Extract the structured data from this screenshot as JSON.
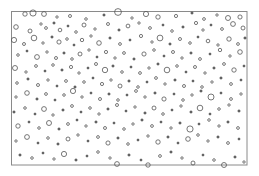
{
  "figure": {
    "title": "",
    "background_color": "#ffffff",
    "width": 259,
    "height": 176
  },
  "frame": {
    "name": "plot-border-rectangle",
    "x": 11.5,
    "y": 11.5,
    "width": 235.5,
    "height": 153.5,
    "stroke_color": "#8a8a8a",
    "stroke_width": 1,
    "fill": "none"
  },
  "chart_data": {
    "type": "scatter",
    "title": "",
    "xlabel": "",
    "ylabel": "",
    "xlim": [
      11,
      247
    ],
    "ylim": [
      11,
      165
    ],
    "grid": false,
    "legend": null,
    "marker": {
      "shape": "circle",
      "fill": "none",
      "stroke_color": "#555555",
      "stroke_width": 0.8,
      "radius_range": [
        0.9,
        4.6
      ]
    },
    "point_count": 231,
    "points": [
      {
        "x": 25,
        "y": 14,
        "r": 2.2
      },
      {
        "x": 33,
        "y": 13,
        "r": 3.1
      },
      {
        "x": 44,
        "y": 14,
        "r": 2.4
      },
      {
        "x": 57,
        "y": 17,
        "r": 1.2
      },
      {
        "x": 70,
        "y": 16,
        "r": 1.5
      },
      {
        "x": 86,
        "y": 19,
        "r": 1.3
      },
      {
        "x": 104,
        "y": 15,
        "r": 1.1
      },
      {
        "x": 118,
        "y": 12,
        "r": 3.4
      },
      {
        "x": 132,
        "y": 18,
        "r": 1.2
      },
      {
        "x": 146,
        "y": 14,
        "r": 2.6
      },
      {
        "x": 158,
        "y": 17,
        "r": 2.2
      },
      {
        "x": 176,
        "y": 16,
        "r": 1.6
      },
      {
        "x": 192,
        "y": 13,
        "r": 1.1
      },
      {
        "x": 204,
        "y": 19,
        "r": 1.4
      },
      {
        "x": 217,
        "y": 15,
        "r": 1.2
      },
      {
        "x": 228,
        "y": 18,
        "r": 2.5
      },
      {
        "x": 240,
        "y": 17,
        "r": 2.1
      },
      {
        "x": 16,
        "y": 27,
        "r": 2.3
      },
      {
        "x": 30,
        "y": 31,
        "r": 2.0
      },
      {
        "x": 41,
        "y": 24,
        "r": 1.2
      },
      {
        "x": 46,
        "y": 28,
        "r": 1.4
      },
      {
        "x": 54,
        "y": 23,
        "r": 1.1
      },
      {
        "x": 60,
        "y": 30,
        "r": 1.8
      },
      {
        "x": 68,
        "y": 26,
        "r": 1.0
      },
      {
        "x": 76,
        "y": 32,
        "r": 1.3
      },
      {
        "x": 84,
        "y": 25,
        "r": 2.0
      },
      {
        "x": 95,
        "y": 29,
        "r": 1.2
      },
      {
        "x": 108,
        "y": 24,
        "r": 1.5
      },
      {
        "x": 119,
        "y": 30,
        "r": 1.1
      },
      {
        "x": 128,
        "y": 26,
        "r": 1.9
      },
      {
        "x": 139,
        "y": 23,
        "r": 1.2
      },
      {
        "x": 150,
        "y": 28,
        "r": 1.4
      },
      {
        "x": 163,
        "y": 25,
        "r": 1.0
      },
      {
        "x": 172,
        "y": 31,
        "r": 1.3
      },
      {
        "x": 183,
        "y": 27,
        "r": 1.1
      },
      {
        "x": 196,
        "y": 23,
        "r": 1.6
      },
      {
        "x": 203,
        "y": 30,
        "r": 1.2
      },
      {
        "x": 211,
        "y": 25,
        "r": 1.0
      },
      {
        "x": 222,
        "y": 29,
        "r": 1.4
      },
      {
        "x": 233,
        "y": 24,
        "r": 2.4
      },
      {
        "x": 243,
        "y": 28,
        "r": 2.0
      },
      {
        "x": 14,
        "y": 40,
        "r": 2.6
      },
      {
        "x": 24,
        "y": 44,
        "r": 1.5
      },
      {
        "x": 34,
        "y": 38,
        "r": 2.8
      },
      {
        "x": 43,
        "y": 43,
        "r": 1.2
      },
      {
        "x": 52,
        "y": 37,
        "r": 1.1
      },
      {
        "x": 59,
        "y": 42,
        "r": 2.1
      },
      {
        "x": 67,
        "y": 39,
        "r": 1.3
      },
      {
        "x": 74,
        "y": 45,
        "r": 1.0
      },
      {
        "x": 82,
        "y": 40,
        "r": 1.7
      },
      {
        "x": 91,
        "y": 36,
        "r": 1.2
      },
      {
        "x": 99,
        "y": 43,
        "r": 2.3
      },
      {
        "x": 110,
        "y": 38,
        "r": 1.1
      },
      {
        "x": 120,
        "y": 44,
        "r": 1.4
      },
      {
        "x": 130,
        "y": 40,
        "r": 1.0
      },
      {
        "x": 141,
        "y": 36,
        "r": 1.6
      },
      {
        "x": 152,
        "y": 42,
        "r": 1.2
      },
      {
        "x": 160,
        "y": 38,
        "r": 2.9
      },
      {
        "x": 170,
        "y": 44,
        "r": 1.1
      },
      {
        "x": 180,
        "y": 39,
        "r": 1.5
      },
      {
        "x": 190,
        "y": 43,
        "r": 1.3
      },
      {
        "x": 198,
        "y": 37,
        "r": 1.0
      },
      {
        "x": 208,
        "y": 41,
        "r": 1.8
      },
      {
        "x": 218,
        "y": 45,
        "r": 1.2
      },
      {
        "x": 229,
        "y": 39,
        "r": 2.2
      },
      {
        "x": 238,
        "y": 44,
        "r": 1.4
      },
      {
        "x": 245,
        "y": 38,
        "r": 1.1
      },
      {
        "x": 18,
        "y": 55,
        "r": 1.3
      },
      {
        "x": 27,
        "y": 51,
        "r": 1.0
      },
      {
        "x": 37,
        "y": 57,
        "r": 2.4
      },
      {
        "x": 47,
        "y": 52,
        "r": 1.2
      },
      {
        "x": 56,
        "y": 58,
        "r": 1.5
      },
      {
        "x": 64,
        "y": 53,
        "r": 1.1
      },
      {
        "x": 72,
        "y": 59,
        "r": 1.3
      },
      {
        "x": 80,
        "y": 54,
        "r": 2.0
      },
      {
        "x": 89,
        "y": 50,
        "r": 1.2
      },
      {
        "x": 97,
        "y": 57,
        "r": 1.0
      },
      {
        "x": 106,
        "y": 52,
        "r": 1.6
      },
      {
        "x": 115,
        "y": 58,
        "r": 1.2
      },
      {
        "x": 124,
        "y": 53,
        "r": 1.4
      },
      {
        "x": 134,
        "y": 59,
        "r": 1.1
      },
      {
        "x": 144,
        "y": 54,
        "r": 2.1
      },
      {
        "x": 154,
        "y": 50,
        "r": 1.3
      },
      {
        "x": 164,
        "y": 56,
        "r": 1.0
      },
      {
        "x": 173,
        "y": 52,
        "r": 1.5
      },
      {
        "x": 182,
        "y": 58,
        "r": 1.2
      },
      {
        "x": 191,
        "y": 53,
        "r": 1.1
      },
      {
        "x": 200,
        "y": 59,
        "r": 1.4
      },
      {
        "x": 210,
        "y": 54,
        "r": 1.0
      },
      {
        "x": 220,
        "y": 50,
        "r": 1.7
      },
      {
        "x": 230,
        "y": 56,
        "r": 1.2
      },
      {
        "x": 240,
        "y": 52,
        "r": 2.3
      },
      {
        "x": 15,
        "y": 68,
        "r": 2.5
      },
      {
        "x": 26,
        "y": 72,
        "r": 1.2
      },
      {
        "x": 36,
        "y": 66,
        "r": 1.4
      },
      {
        "x": 45,
        "y": 71,
        "r": 1.0
      },
      {
        "x": 53,
        "y": 65,
        "r": 1.3
      },
      {
        "x": 62,
        "y": 70,
        "r": 1.1
      },
      {
        "x": 71,
        "y": 67,
        "r": 1.6
      },
      {
        "x": 79,
        "y": 73,
        "r": 1.2
      },
      {
        "x": 88,
        "y": 68,
        "r": 1.0
      },
      {
        "x": 96,
        "y": 64,
        "r": 1.5
      },
      {
        "x": 105,
        "y": 70,
        "r": 2.7
      },
      {
        "x": 113,
        "y": 66,
        "r": 1.1
      },
      {
        "x": 122,
        "y": 72,
        "r": 1.3
      },
      {
        "x": 131,
        "y": 67,
        "r": 1.0
      },
      {
        "x": 140,
        "y": 73,
        "r": 1.4
      },
      {
        "x": 149,
        "y": 68,
        "r": 1.2
      },
      {
        "x": 158,
        "y": 64,
        "r": 1.1
      },
      {
        "x": 167,
        "y": 70,
        "r": 2.8
      },
      {
        "x": 177,
        "y": 66,
        "r": 1.3
      },
      {
        "x": 186,
        "y": 72,
        "r": 1.0
      },
      {
        "x": 195,
        "y": 67,
        "r": 1.5
      },
      {
        "x": 205,
        "y": 73,
        "r": 1.2
      },
      {
        "x": 214,
        "y": 68,
        "r": 1.1
      },
      {
        "x": 224,
        "y": 64,
        "r": 1.4
      },
      {
        "x": 234,
        "y": 70,
        "r": 2.2
      },
      {
        "x": 244,
        "y": 66,
        "r": 1.0
      },
      {
        "x": 17,
        "y": 83,
        "r": 1.3
      },
      {
        "x": 28,
        "y": 79,
        "r": 1.1
      },
      {
        "x": 38,
        "y": 85,
        "r": 1.5
      },
      {
        "x": 48,
        "y": 80,
        "r": 1.2
      },
      {
        "x": 57,
        "y": 86,
        "r": 1.0
      },
      {
        "x": 66,
        "y": 81,
        "r": 1.4
      },
      {
        "x": 75,
        "y": 87,
        "r": 1.1
      },
      {
        "x": 84,
        "y": 82,
        "r": 1.3
      },
      {
        "x": 93,
        "y": 78,
        "r": 1.0
      },
      {
        "x": 102,
        "y": 84,
        "r": 1.6
      },
      {
        "x": 111,
        "y": 80,
        "r": 1.2
      },
      {
        "x": 120,
        "y": 86,
        "r": 2.0
      },
      {
        "x": 129,
        "y": 81,
        "r": 1.1
      },
      {
        "x": 138,
        "y": 87,
        "r": 1.3
      },
      {
        "x": 147,
        "y": 82,
        "r": 1.0
      },
      {
        "x": 156,
        "y": 78,
        "r": 1.4
      },
      {
        "x": 165,
        "y": 84,
        "r": 1.2
      },
      {
        "x": 175,
        "y": 80,
        "r": 1.1
      },
      {
        "x": 184,
        "y": 86,
        "r": 1.5
      },
      {
        "x": 193,
        "y": 81,
        "r": 1.0
      },
      {
        "x": 202,
        "y": 87,
        "r": 1.3
      },
      {
        "x": 212,
        "y": 82,
        "r": 1.2
      },
      {
        "x": 221,
        "y": 78,
        "r": 1.1
      },
      {
        "x": 231,
        "y": 84,
        "r": 1.4
      },
      {
        "x": 241,
        "y": 80,
        "r": 1.0
      },
      {
        "x": 16,
        "y": 97,
        "r": 1.2
      },
      {
        "x": 27,
        "y": 93,
        "r": 2.3
      },
      {
        "x": 37,
        "y": 99,
        "r": 1.1
      },
      {
        "x": 46,
        "y": 94,
        "r": 1.4
      },
      {
        "x": 55,
        "y": 100,
        "r": 1.0
      },
      {
        "x": 64,
        "y": 95,
        "r": 1.3
      },
      {
        "x": 73,
        "y": 91,
        "r": 2.6
      },
      {
        "x": 82,
        "y": 97,
        "r": 1.2
      },
      {
        "x": 91,
        "y": 93,
        "r": 1.0
      },
      {
        "x": 100,
        "y": 99,
        "r": 1.5
      },
      {
        "x": 109,
        "y": 94,
        "r": 1.1
      },
      {
        "x": 118,
        "y": 100,
        "r": 1.3
      },
      {
        "x": 127,
        "y": 95,
        "r": 1.0
      },
      {
        "x": 136,
        "y": 91,
        "r": 1.4
      },
      {
        "x": 145,
        "y": 97,
        "r": 1.2
      },
      {
        "x": 155,
        "y": 93,
        "r": 1.1
      },
      {
        "x": 164,
        "y": 99,
        "r": 2.1
      },
      {
        "x": 174,
        "y": 94,
        "r": 1.0
      },
      {
        "x": 183,
        "y": 100,
        "r": 1.3
      },
      {
        "x": 192,
        "y": 95,
        "r": 1.2
      },
      {
        "x": 201,
        "y": 91,
        "r": 1.1
      },
      {
        "x": 211,
        "y": 97,
        "r": 3.0
      },
      {
        "x": 221,
        "y": 93,
        "r": 1.0
      },
      {
        "x": 231,
        "y": 99,
        "r": 1.4
      },
      {
        "x": 241,
        "y": 94,
        "r": 1.2
      },
      {
        "x": 14,
        "y": 112,
        "r": 1.1
      },
      {
        "x": 25,
        "y": 108,
        "r": 1.3
      },
      {
        "x": 35,
        "y": 114,
        "r": 1.0
      },
      {
        "x": 44,
        "y": 109,
        "r": 2.4
      },
      {
        "x": 53,
        "y": 115,
        "r": 1.2
      },
      {
        "x": 63,
        "y": 110,
        "r": 1.1
      },
      {
        "x": 72,
        "y": 106,
        "r": 1.4
      },
      {
        "x": 81,
        "y": 112,
        "r": 1.0
      },
      {
        "x": 90,
        "y": 108,
        "r": 1.3
      },
      {
        "x": 99,
        "y": 114,
        "r": 1.2
      },
      {
        "x": 108,
        "y": 109,
        "r": 1.1
      },
      {
        "x": 117,
        "y": 105,
        "r": 1.5
      },
      {
        "x": 126,
        "y": 111,
        "r": 1.0
      },
      {
        "x": 135,
        "y": 107,
        "r": 1.2
      },
      {
        "x": 145,
        "y": 113,
        "r": 1.1
      },
      {
        "x": 154,
        "y": 108,
        "r": 2.0
      },
      {
        "x": 163,
        "y": 114,
        "r": 1.3
      },
      {
        "x": 172,
        "y": 110,
        "r": 1.0
      },
      {
        "x": 181,
        "y": 106,
        "r": 1.2
      },
      {
        "x": 191,
        "y": 112,
        "r": 1.1
      },
      {
        "x": 200,
        "y": 108,
        "r": 2.8
      },
      {
        "x": 210,
        "y": 114,
        "r": 1.0
      },
      {
        "x": 219,
        "y": 109,
        "r": 1.3
      },
      {
        "x": 229,
        "y": 105,
        "r": 1.2
      },
      {
        "x": 239,
        "y": 111,
        "r": 1.1
      },
      {
        "x": 18,
        "y": 126,
        "r": 2.2
      },
      {
        "x": 29,
        "y": 122,
        "r": 1.0
      },
      {
        "x": 39,
        "y": 128,
        "r": 1.3
      },
      {
        "x": 49,
        "y": 123,
        "r": 2.5
      },
      {
        "x": 59,
        "y": 129,
        "r": 1.1
      },
      {
        "x": 68,
        "y": 124,
        "r": 1.4
      },
      {
        "x": 77,
        "y": 120,
        "r": 1.0
      },
      {
        "x": 86,
        "y": 126,
        "r": 1.2
      },
      {
        "x": 96,
        "y": 122,
        "r": 1.1
      },
      {
        "x": 105,
        "y": 128,
        "r": 1.5
      },
      {
        "x": 114,
        "y": 123,
        "r": 1.0
      },
      {
        "x": 124,
        "y": 129,
        "r": 1.3
      },
      {
        "x": 133,
        "y": 124,
        "r": 1.2
      },
      {
        "x": 142,
        "y": 120,
        "r": 1.1
      },
      {
        "x": 152,
        "y": 126,
        "r": 1.4
      },
      {
        "x": 161,
        "y": 122,
        "r": 1.0
      },
      {
        "x": 171,
        "y": 128,
        "r": 1.2
      },
      {
        "x": 180,
        "y": 123,
        "r": 1.1
      },
      {
        "x": 190,
        "y": 129,
        "r": 3.1
      },
      {
        "x": 199,
        "y": 124,
        "r": 1.0
      },
      {
        "x": 209,
        "y": 120,
        "r": 1.3
      },
      {
        "x": 219,
        "y": 126,
        "r": 1.2
      },
      {
        "x": 228,
        "y": 122,
        "r": 1.1
      },
      {
        "x": 238,
        "y": 128,
        "r": 1.4
      },
      {
        "x": 16,
        "y": 141,
        "r": 1.2
      },
      {
        "x": 27,
        "y": 137,
        "r": 2.4
      },
      {
        "x": 38,
        "y": 143,
        "r": 1.0
      },
      {
        "x": 48,
        "y": 138,
        "r": 1.3
      },
      {
        "x": 58,
        "y": 144,
        "r": 1.1
      },
      {
        "x": 68,
        "y": 139,
        "r": 2.0
      },
      {
        "x": 78,
        "y": 135,
        "r": 1.2
      },
      {
        "x": 88,
        "y": 141,
        "r": 1.0
      },
      {
        "x": 98,
        "y": 137,
        "r": 1.4
      },
      {
        "x": 108,
        "y": 143,
        "r": 2.1
      },
      {
        "x": 118,
        "y": 138,
        "r": 1.1
      },
      {
        "x": 128,
        "y": 144,
        "r": 1.3
      },
      {
        "x": 138,
        "y": 140,
        "r": 1.0
      },
      {
        "x": 148,
        "y": 136,
        "r": 1.2
      },
      {
        "x": 158,
        "y": 142,
        "r": 2.2
      },
      {
        "x": 168,
        "y": 137,
        "r": 1.1
      },
      {
        "x": 178,
        "y": 143,
        "r": 1.0
      },
      {
        "x": 188,
        "y": 139,
        "r": 2.3
      },
      {
        "x": 198,
        "y": 135,
        "r": 1.3
      },
      {
        "x": 208,
        "y": 141,
        "r": 1.2
      },
      {
        "x": 218,
        "y": 137,
        "r": 1.1
      },
      {
        "x": 228,
        "y": 143,
        "r": 1.4
      },
      {
        "x": 239,
        "y": 139,
        "r": 1.0
      },
      {
        "x": 20,
        "y": 155,
        "r": 1.1
      },
      {
        "x": 32,
        "y": 158,
        "r": 1.3
      },
      {
        "x": 43,
        "y": 153,
        "r": 1.0
      },
      {
        "x": 54,
        "y": 159,
        "r": 1.2
      },
      {
        "x": 64,
        "y": 154,
        "r": 2.6
      },
      {
        "x": 76,
        "y": 160,
        "r": 1.1
      },
      {
        "x": 87,
        "y": 156,
        "r": 1.0
      },
      {
        "x": 98,
        "y": 152,
        "r": 1.3
      },
      {
        "x": 110,
        "y": 158,
        "r": 1.2
      },
      {
        "x": 117,
        "y": 164,
        "r": 2.4
      },
      {
        "x": 129,
        "y": 155,
        "r": 1.1
      },
      {
        "x": 141,
        "y": 160,
        "r": 1.0
      },
      {
        "x": 148,
        "y": 165,
        "r": 2.2
      },
      {
        "x": 160,
        "y": 156,
        "r": 1.4
      },
      {
        "x": 171,
        "y": 152,
        "r": 1.1
      },
      {
        "x": 182,
        "y": 158,
        "r": 1.2
      },
      {
        "x": 193,
        "y": 163,
        "r": 2.0
      },
      {
        "x": 203,
        "y": 155,
        "r": 1.0
      },
      {
        "x": 214,
        "y": 160,
        "r": 1.3
      },
      {
        "x": 224,
        "y": 165,
        "r": 2.5
      },
      {
        "x": 235,
        "y": 157,
        "r": 1.1
      },
      {
        "x": 244,
        "y": 162,
        "r": 1.2
      }
    ]
  }
}
